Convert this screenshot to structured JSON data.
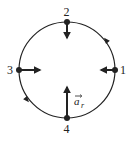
{
  "diagram": {
    "title": "",
    "colors": {
      "stroke": "#222222",
      "background": "#ffffff"
    },
    "circle": {
      "cx": 67,
      "cy": 70,
      "r": 48,
      "direction": "counterclockwise"
    },
    "points": [
      {
        "label": "1",
        "x": 115,
        "y": 70,
        "arrow_to": [
          101,
          70
        ]
      },
      {
        "label": "2",
        "x": 67,
        "y": 22,
        "arrow_to": [
          67,
          38
        ]
      },
      {
        "label": "3",
        "x": 19,
        "y": 70,
        "arrow_to": [
          40,
          70
        ]
      },
      {
        "label": "4",
        "x": 67,
        "y": 118,
        "arrow_to": [
          67,
          87
        ]
      }
    ],
    "vector_label": {
      "text": "a",
      "subscript": "r",
      "x": 74,
      "y": 104
    },
    "motion_arrows": [
      {
        "x": 106,
        "y": 40,
        "angle": -130
      },
      {
        "x": 27,
        "y": 100,
        "angle": 50
      }
    ]
  }
}
